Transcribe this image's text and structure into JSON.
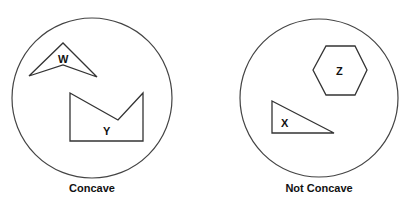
{
  "groups": [
    {
      "caption": "Concave",
      "shapes": [
        {
          "label": "W",
          "type": "concave-arrowhead"
        },
        {
          "label": "Y",
          "type": "concave-pentagon"
        }
      ]
    },
    {
      "caption": "Not Concave",
      "shapes": [
        {
          "label": "Z",
          "type": "hexagon"
        },
        {
          "label": "X",
          "type": "right-triangle"
        }
      ]
    }
  ]
}
